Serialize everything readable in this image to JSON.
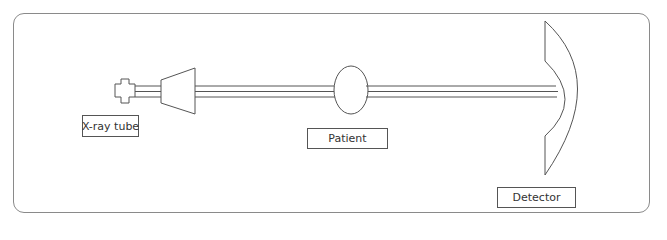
{
  "diagram": {
    "title": "",
    "stroke_color": "#555555",
    "frame_color": "#8a8a8a",
    "components": [
      {
        "id": "xray-tube",
        "label": "X-ray tube"
      },
      {
        "id": "patient",
        "label": "Patient"
      },
      {
        "id": "detector",
        "label": "Detector"
      }
    ],
    "beam": {
      "line_count": 3
    }
  }
}
